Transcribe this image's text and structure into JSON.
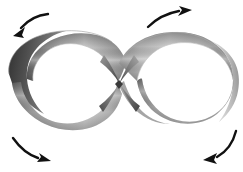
{
  "figure": {
    "title": "Figure-eight twisted band with rotation arrows",
    "caption": "",
    "background_color": "#ffffff",
    "width": 243,
    "height": 172,
    "shape_name": "figure-eight-band",
    "shape_description": "Mobius-like ribbon bent into an infinity / figure-eight loop, crossing at the center",
    "band": {
      "material": "grayscale-metallic",
      "colors": {
        "dark": "#4a4a4a",
        "mid_dark": "#6e6e6e",
        "mid": "#9a9a9a",
        "light": "#d9d9d9",
        "highlight": "#f2f2f2",
        "outline": "#7d7d7d"
      },
      "loops": [
        {
          "name": "left-loop",
          "center_x": 62,
          "center_y": 86,
          "radius_x": 57,
          "radius_y": 48,
          "dark_edge": "left"
        },
        {
          "name": "right-loop",
          "center_x": 176,
          "center_y": 86,
          "radius_x": 57,
          "radius_y": 48,
          "dark_edge": "center"
        }
      ],
      "crossing": {
        "name": "center-crossing",
        "x": 119,
        "y": 84
      }
    },
    "arrows": {
      "color": "#111111",
      "items": [
        {
          "name": "arrow-top-left",
          "position": "top-left",
          "direction": "down-left",
          "meaning": "counter-clockwise rotation of left loop"
        },
        {
          "name": "arrow-top-right",
          "position": "top-right",
          "direction": "up-right",
          "meaning": "clockwise rotation of right loop"
        },
        {
          "name": "arrow-bottom-left",
          "position": "bottom-left",
          "direction": "right",
          "meaning": "counter-clockwise rotation of left loop"
        },
        {
          "name": "arrow-bottom-right",
          "position": "bottom-right",
          "direction": "left",
          "meaning": "clockwise rotation of right loop"
        }
      ]
    }
  }
}
